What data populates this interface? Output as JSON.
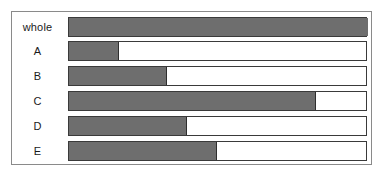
{
  "figure": {
    "title": "",
    "frame_border_color": "#8a8a8a",
    "background_color": "#ffffff"
  },
  "chart_data": {
    "type": "bar",
    "orientation": "horizontal",
    "title": "",
    "subtitle": "",
    "xlabel": "",
    "ylabel": "",
    "xlim": [
      0,
      100
    ],
    "grid": false,
    "legend": null,
    "annotations": [],
    "unit": "percent of whole",
    "fill_color": "#6e6e6e",
    "track_color": "#ffffff",
    "outline_color": "#3a3a3a",
    "categories": [
      "whole",
      "A",
      "B",
      "C",
      "D",
      "E"
    ],
    "values": [
      100,
      16.7,
      32.8,
      82.6,
      39.5,
      49.5
    ],
    "tick_labels": [
      "whole",
      "A",
      "B",
      "C",
      "D",
      "E"
    ],
    "series": [
      {
        "name": "filled fraction",
        "values": [
          100,
          16.7,
          32.8,
          82.6,
          39.5,
          49.5
        ]
      }
    ]
  },
  "rows": [
    {
      "label": "whole",
      "value": 100
    },
    {
      "label": "A",
      "value": 16.7
    },
    {
      "label": "B",
      "value": 32.8
    },
    {
      "label": "C",
      "value": 82.6
    },
    {
      "label": "D",
      "value": 39.5
    },
    {
      "label": "E",
      "value": 49.5
    }
  ]
}
